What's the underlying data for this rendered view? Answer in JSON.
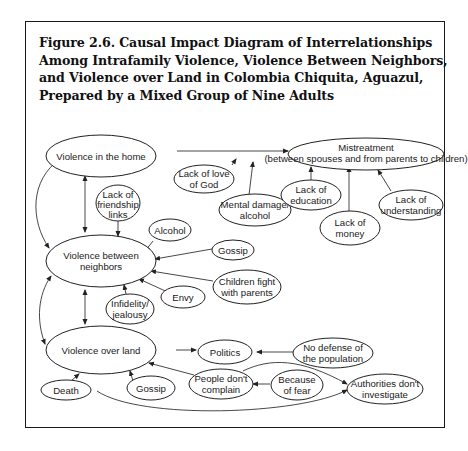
{
  "figure": {
    "title_lines": [
      "Figure 2.6. Causal Impact Diagram of Interrelationships",
      "Among Intrafamily Violence, Violence Between Neighbors,",
      "and Violence over Land in Colombia Chiquita, Aguazul,",
      "Prepared by a Mixed Group of Nine Adults"
    ]
  },
  "nodes": {
    "violence_home": {
      "lines": [
        "Violence in the home"
      ]
    },
    "mistreatment": {
      "lines": [
        "Mistreatment",
        "(between spouses and from parents to children)"
      ]
    },
    "lack_love_god": {
      "lines": [
        "Lack of love",
        "of God"
      ]
    },
    "mental_damage": {
      "lines": [
        "Mental damage/",
        "alcohol"
      ]
    },
    "lack_education": {
      "lines": [
        "Lack of",
        "education"
      ]
    },
    "lack_money": {
      "lines": [
        "Lack of",
        "money"
      ]
    },
    "lack_understanding": {
      "lines": [
        "Lack of",
        "understanding"
      ]
    },
    "lack_friendship": {
      "lines": [
        "Lack of",
        "friendship",
        "links"
      ]
    },
    "alcohol": {
      "lines": [
        "Alcohol"
      ]
    },
    "violence_neighbors": {
      "lines": [
        "Violence between",
        "neighbors"
      ]
    },
    "gossip_neighbors": {
      "lines": [
        "Gossip"
      ]
    },
    "children_fight": {
      "lines": [
        "Children fight",
        "with parents"
      ]
    },
    "envy": {
      "lines": [
        "Envy"
      ]
    },
    "infidelity": {
      "lines": [
        "Infidelity/",
        "jealousy"
      ]
    },
    "violence_land": {
      "lines": [
        "Violence over land"
      ]
    },
    "politics": {
      "lines": [
        "Politics"
      ]
    },
    "no_defense": {
      "lines": [
        "No defense of",
        "the population"
      ]
    },
    "death": {
      "lines": [
        "Death"
      ]
    },
    "gossip_land": {
      "lines": [
        "Gossip"
      ]
    },
    "people_dont_complain": {
      "lines": [
        "People don't",
        "complain"
      ]
    },
    "because_fear": {
      "lines": [
        "Because",
        "of fear"
      ]
    },
    "authorities": {
      "lines": [
        "Authorities don't",
        "investigate"
      ]
    }
  },
  "edges": [
    {
      "from": "violence_home",
      "to": "mistreatment"
    },
    {
      "from": "lack_love_god",
      "to": "mistreatment"
    },
    {
      "from": "mental_damage",
      "to": "mistreatment"
    },
    {
      "from": "lack_education",
      "to": "mistreatment"
    },
    {
      "from": "lack_money",
      "to": "mistreatment"
    },
    {
      "from": "lack_understanding",
      "to": "mistreatment"
    },
    {
      "from": "violence_home",
      "to": "violence_neighbors",
      "bidirectional": true
    },
    {
      "from": "violence_home",
      "to": "violence_neighbors",
      "bidirectional": true,
      "curved": true
    },
    {
      "from": "lack_friendship",
      "to": "violence_neighbors"
    },
    {
      "from": "alcohol",
      "to": "violence_neighbors"
    },
    {
      "from": "gossip_neighbors",
      "to": "violence_neighbors"
    },
    {
      "from": "children_fight",
      "to": "violence_neighbors"
    },
    {
      "from": "envy",
      "to": "violence_neighbors"
    },
    {
      "from": "infidelity",
      "to": "violence_neighbors"
    },
    {
      "from": "violence_neighbors",
      "to": "violence_land",
      "bidirectional": true
    },
    {
      "from": "violence_neighbors",
      "to": "violence_land",
      "bidirectional": true,
      "curved": true
    },
    {
      "from": "violence_home",
      "to": "violence_land",
      "bidirectional": true,
      "curved": true
    },
    {
      "from": "violence_land",
      "to": "politics"
    },
    {
      "from": "no_defense",
      "to": "politics"
    },
    {
      "from": "death",
      "to": "violence_land"
    },
    {
      "from": "gossip_land",
      "to": "violence_land"
    },
    {
      "from": "people_dont_complain",
      "to": "violence_land"
    },
    {
      "from": "because_fear",
      "to": "people_dont_complain"
    },
    {
      "from": "people_dont_complain",
      "to": "authorities"
    },
    {
      "from": "death",
      "to": "authorities"
    }
  ]
}
